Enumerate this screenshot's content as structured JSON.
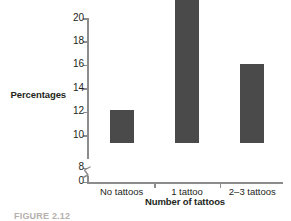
{
  "chart_data": {
    "type": "bar",
    "title": "",
    "categories": [
      "No tattoos",
      "1 tattoo",
      "2–3 tattoos"
    ],
    "values": [
      8.8,
      18.5,
      12.7
    ],
    "xlabel": "Number of tattoos",
    "ylabel": "Percentages",
    "ylim": [
      0,
      20
    ],
    "yticks": [
      0,
      8,
      10,
      12,
      14,
      16,
      18,
      20
    ],
    "ytick_labels": [
      "0",
      "8",
      "10",
      "12",
      "14",
      "16",
      "18",
      "20"
    ],
    "axis_break": {
      "present": true,
      "between": [
        0,
        8
      ],
      "symbol": "zigzag"
    },
    "grid": false,
    "legend": null,
    "bar_color": "#4a4a4a",
    "axis_color": "#8c8c8c",
    "text_color": "#231f20"
  },
  "caption": {
    "text": "FIGURE 2.12"
  }
}
